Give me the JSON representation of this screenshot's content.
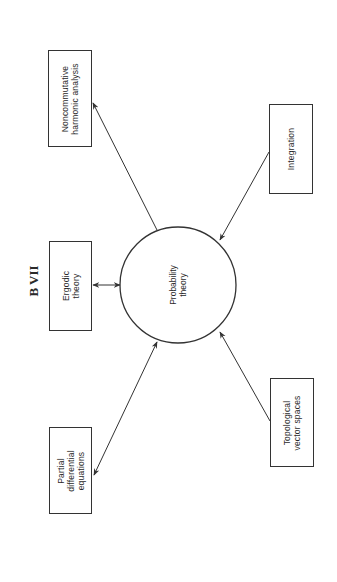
{
  "title": "B VII",
  "center": {
    "lines": [
      "Probability",
      "theory"
    ]
  },
  "nodes": {
    "noncommutative": {
      "lines": [
        "Noncommutative",
        "harmonic analysis"
      ]
    },
    "integration": {
      "lines": [
        "Integration"
      ]
    },
    "ergodic": {
      "lines": [
        "Ergodic",
        "theory"
      ]
    },
    "pde": {
      "lines": [
        "Partial",
        "differential",
        "equations"
      ]
    },
    "topological": {
      "lines": [
        "Topological",
        "vector spaces"
      ]
    }
  },
  "edges": [
    {
      "from": "Probability theory",
      "to": "Noncommutative harmonic analysis",
      "direction": "to"
    },
    {
      "from": "Integration",
      "to": "Probability theory",
      "direction": "to"
    },
    {
      "from": "Ergodic theory",
      "to": "Probability theory",
      "direction": "both"
    },
    {
      "from": "Partial differential equations",
      "to": "Probability theory",
      "direction": "both"
    },
    {
      "from": "Topological vector spaces",
      "to": "Probability theory",
      "direction": "to"
    }
  ],
  "colors": {
    "line": "#333333",
    "background": "#ffffff"
  }
}
